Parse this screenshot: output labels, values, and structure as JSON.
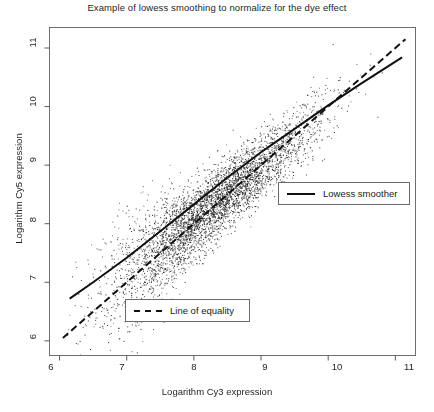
{
  "chart_data": {
    "type": "scatter",
    "title": "Example of lowess smoothing to normalize for the dye effect",
    "xlabel": "Logarithm Cy3 expression",
    "ylabel": "Logarithm Cy5 expression",
    "xlim": [
      5.85,
      11.3
    ],
    "ylim": [
      5.75,
      11.35
    ],
    "xticks": [
      6,
      7,
      8,
      9,
      10,
      11
    ],
    "yticks": [
      6,
      7,
      8,
      9,
      10,
      11
    ],
    "xtick_labels": [
      "6",
      "7",
      "8",
      "9",
      "10",
      "11"
    ],
    "ytick_labels": [
      "6",
      "7",
      "8",
      "9",
      "10",
      "11"
    ],
    "grid": false,
    "point_color": "#1a1a1a",
    "point_size": 1,
    "n_points": 4200,
    "cloud": {
      "x_mean": 8.25,
      "x_sd": 0.78,
      "slope": 0.93,
      "intercept": 0.62,
      "residual_sd": 0.3,
      "x_min": 6.05,
      "x_max": 11.15
    },
    "series": [
      {
        "name": "Lowess smoother",
        "type": "line",
        "style": "solid",
        "color": "#111111",
        "width": 2,
        "points": [
          [
            6.15,
            6.72
          ],
          [
            6.5,
            7.0
          ],
          [
            7.0,
            7.42
          ],
          [
            7.5,
            7.87
          ],
          [
            8.0,
            8.33
          ],
          [
            8.5,
            8.79
          ],
          [
            9.0,
            9.22
          ],
          [
            9.2,
            9.38
          ],
          [
            9.5,
            9.62
          ],
          [
            10.0,
            10.02
          ],
          [
            10.5,
            10.4
          ],
          [
            11.1,
            10.84
          ]
        ]
      },
      {
        "name": "Line of equality",
        "type": "line",
        "style": "dashed",
        "color": "#111111",
        "width": 2,
        "points": [
          [
            6.05,
            6.05
          ],
          [
            11.15,
            11.15
          ]
        ]
      }
    ],
    "legend": [
      {
        "label": "Lowess smoother",
        "style": "solid"
      },
      {
        "label": "Line of equality",
        "style": "dashed"
      }
    ],
    "annotations": []
  },
  "axis": {
    "x_label": "Logarithm Cy3 expression",
    "y_label": "Logarithm Cy5 expression"
  },
  "legend": {
    "lowess": "Lowess smoother",
    "equality": "Line of equality"
  }
}
